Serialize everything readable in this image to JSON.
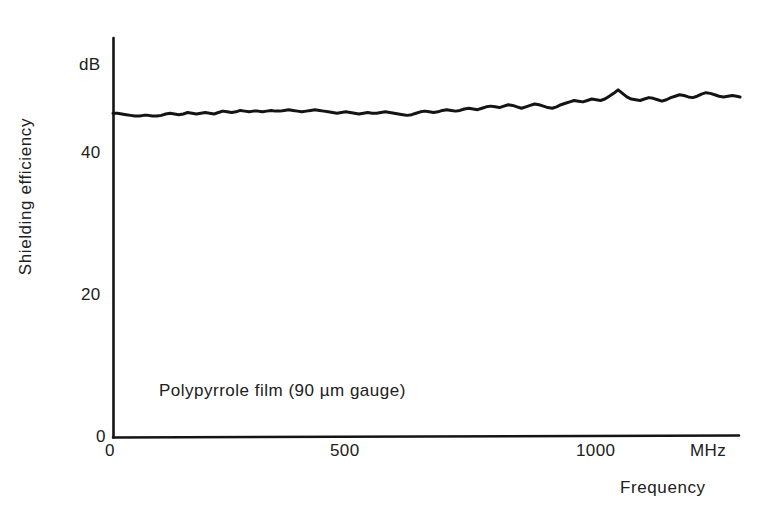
{
  "figure": {
    "background_color": "#ffffff",
    "ink_color": "#141414"
  },
  "axes": {
    "y_unit_label": "dB",
    "y_title": "Shielding efficiency",
    "x_unit_label": "MHz",
    "x_title": "Frequency",
    "y_ticks": [
      "0",
      "20",
      "40"
    ],
    "x_ticks": [
      "0",
      "500",
      "1000"
    ]
  },
  "annotation": {
    "text": "Polypyrrole film (90 µm gauge)"
  },
  "chart_data": {
    "type": "line",
    "title": "",
    "subtitle": "",
    "xlabel": "Frequency",
    "ylabel": "Shielding efficiency",
    "x_unit": "MHz",
    "y_unit": "dB",
    "xlim": [
      0,
      1285
    ],
    "ylim": [
      0,
      56
    ],
    "xticks": [
      0,
      500,
      1000
    ],
    "yticks": [
      0,
      20,
      40
    ],
    "grid": false,
    "legend": null,
    "annotations": [
      {
        "text": "Polypyrrole film (90 µm gauge)",
        "x": 190,
        "y": 6.2
      }
    ],
    "series": [
      {
        "name": "Polypyrrole film (90 um gauge)",
        "color": "#141414",
        "line_width": 3,
        "x": [
          0,
          9,
          18,
          27,
          36,
          45,
          54,
          63,
          72,
          81,
          90,
          99,
          108,
          117,
          126,
          135,
          144,
          153,
          162,
          171,
          180,
          189,
          198,
          207,
          216,
          225,
          234,
          243,
          252,
          261,
          270,
          279,
          288,
          297,
          306,
          315,
          324,
          333,
          342,
          351,
          360,
          369,
          378,
          387,
          396,
          405,
          414,
          423,
          432,
          441,
          450,
          459,
          468,
          477,
          486,
          495,
          504,
          513,
          522,
          531,
          540,
          549,
          558,
          567,
          576,
          585,
          594,
          603,
          612,
          621,
          630,
          639,
          648,
          657,
          666,
          675,
          684,
          693,
          702,
          711,
          720,
          729,
          738,
          747,
          756,
          765,
          774,
          783,
          792,
          801,
          810,
          819,
          828,
          837,
          846,
          855,
          864,
          873,
          882,
          891,
          900,
          909,
          918,
          927,
          936,
          945,
          954,
          963,
          972,
          981,
          990,
          999,
          1008,
          1017,
          1026,
          1035,
          1044,
          1053,
          1062,
          1071,
          1080,
          1089,
          1098,
          1107,
          1116,
          1125,
          1134,
          1143,
          1152,
          1161,
          1170,
          1179,
          1188,
          1197,
          1206,
          1215,
          1224,
          1233,
          1242,
          1251,
          1260,
          1269,
          1278,
          1285
        ],
        "y": [
          45.6,
          45.6,
          45.5,
          45.4,
          45.3,
          45.2,
          45.2,
          45.3,
          45.3,
          45.2,
          45.2,
          45.3,
          45.5,
          45.6,
          45.5,
          45.4,
          45.5,
          45.7,
          45.6,
          45.5,
          45.6,
          45.7,
          45.6,
          45.5,
          45.7,
          45.9,
          45.8,
          45.7,
          45.8,
          46.0,
          45.9,
          45.8,
          45.9,
          45.9,
          45.8,
          45.9,
          46.0,
          45.9,
          45.9,
          46.0,
          46.1,
          46.0,
          45.9,
          45.8,
          45.9,
          46.0,
          46.1,
          46.0,
          45.9,
          45.8,
          45.7,
          45.6,
          45.7,
          45.8,
          45.7,
          45.6,
          45.5,
          45.6,
          45.7,
          45.6,
          45.6,
          45.7,
          45.8,
          45.7,
          45.6,
          45.5,
          45.4,
          45.3,
          45.4,
          45.6,
          45.8,
          45.9,
          45.8,
          45.7,
          45.8,
          46.0,
          46.1,
          46.0,
          45.9,
          46.0,
          46.2,
          46.3,
          46.2,
          46.1,
          46.3,
          46.5,
          46.6,
          46.5,
          46.4,
          46.6,
          46.8,
          46.7,
          46.5,
          46.3,
          46.5,
          46.7,
          46.9,
          46.8,
          46.6,
          46.4,
          46.3,
          46.5,
          46.8,
          47.0,
          47.2,
          47.4,
          47.3,
          47.2,
          47.4,
          47.6,
          47.5,
          47.4,
          47.6,
          48.0,
          48.4,
          48.9,
          48.4,
          47.9,
          47.6,
          47.5,
          47.4,
          47.6,
          47.8,
          47.7,
          47.5,
          47.3,
          47.5,
          47.8,
          48.0,
          48.2,
          48.1,
          47.9,
          47.8,
          48.0,
          48.3,
          48.5,
          48.4,
          48.2,
          48.0,
          47.9,
          48.0,
          48.1,
          48.0,
          47.9
        ]
      }
    ]
  }
}
